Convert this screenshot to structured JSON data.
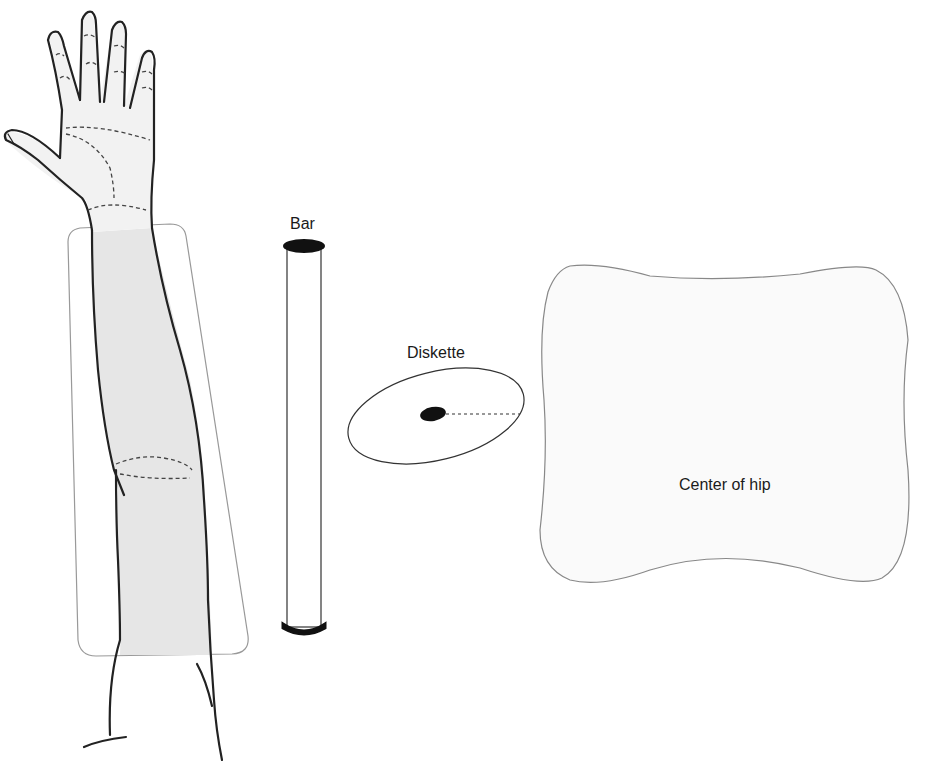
{
  "diagram": {
    "labels": {
      "bar": "Bar",
      "diskette": "Diskette",
      "hip": "Center of hip"
    },
    "objects": [
      {
        "id": "arm",
        "description": "upright arm with shaded forearm region inside rounded trapezoid"
      },
      {
        "id": "bar",
        "description": "vertical cylinder with dark end caps"
      },
      {
        "id": "diskette",
        "description": "tilted ellipse with dark center spot and dashed radius line"
      },
      {
        "id": "hip",
        "description": "pillow-shaped region labeled center of hip"
      }
    ],
    "colors": {
      "outline": "#222222",
      "shade": "#e6e6e6",
      "light_fill": "#f7f7f7",
      "thin_outline": "#888888"
    }
  }
}
